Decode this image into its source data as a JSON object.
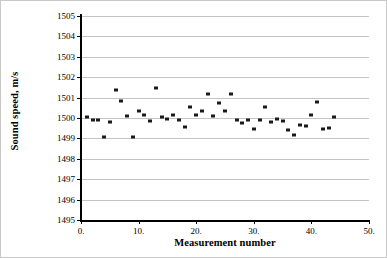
{
  "chart_data": {
    "type": "scatter",
    "title": "",
    "xlabel": "Measurement number",
    "ylabel": "Sound speed, m/s",
    "xlim": [
      0,
      50
    ],
    "ylim": [
      1495,
      1505
    ],
    "grid": true,
    "legend": false,
    "x_tick_labels": [
      "0.",
      "10.",
      "20.",
      "30.",
      "40.",
      "50."
    ],
    "x_tick_values": [
      0,
      10,
      20,
      30,
      40,
      50
    ],
    "x_minor_step": 2,
    "y_tick_labels": [
      "1495",
      "1496",
      "1497",
      "1498",
      "1499",
      "1500",
      "1501",
      "1502",
      "1503",
      "1504",
      "1505"
    ],
    "y_tick_values": [
      1495,
      1496,
      1497,
      1498,
      1499,
      1500,
      1501,
      1502,
      1503,
      1504,
      1505
    ],
    "marker": "square",
    "marker_color": "#1a1a1a",
    "gridline_color": "#c4c4c4",
    "axis_color": "#000000",
    "background_color": "#ffffff",
    "x": [
      1,
      2,
      3,
      4,
      5,
      6,
      7,
      8,
      9,
      10,
      11,
      12,
      13,
      14,
      15,
      16,
      17,
      18,
      19,
      20,
      21,
      22,
      23,
      24,
      25,
      26,
      27,
      28,
      29,
      30,
      31,
      32,
      33,
      34,
      35,
      36,
      37,
      38,
      39,
      40,
      41,
      42,
      43
    ],
    "y": [
      1500.05,
      1499.9,
      1499.9,
      1499.05,
      1499.8,
      1501.35,
      1500.85,
      1500.1,
      1499.05,
      1500.35,
      1500.15,
      1499.85,
      1501.45,
      1500.05,
      1499.95,
      1500.15,
      1499.9,
      1499.55,
      1500.55,
      1500.15,
      1500.35,
      1501.2,
      1500.1,
      1500.75,
      1500.35,
      1501.2,
      1499.9,
      1499.75,
      1499.9,
      1499.45,
      1499.9,
      1500.55,
      1499.8,
      1499.95,
      1499.85,
      1499.4,
      1499.15,
      1499.65,
      1499.6,
      1500.15,
      1500.8,
      1499.45,
      1499.5,
      1500.05
    ],
    "series": [
      {
        "name": "Sound speed measurements",
        "points": [
          {
            "x": 1,
            "y": 1500.05
          },
          {
            "x": 2,
            "y": 1499.9
          },
          {
            "x": 3,
            "y": 1499.9
          },
          {
            "x": 4,
            "y": 1499.05
          },
          {
            "x": 5,
            "y": 1499.8
          },
          {
            "x": 6,
            "y": 1501.35
          },
          {
            "x": 7,
            "y": 1500.85
          },
          {
            "x": 8,
            "y": 1500.1
          },
          {
            "x": 9,
            "y": 1499.05
          },
          {
            "x": 10,
            "y": 1500.35
          },
          {
            "x": 11,
            "y": 1500.15
          },
          {
            "x": 12,
            "y": 1499.85
          },
          {
            "x": 13,
            "y": 1501.45
          },
          {
            "x": 14,
            "y": 1500.05
          },
          {
            "x": 15,
            "y": 1499.95
          },
          {
            "x": 16,
            "y": 1500.15
          },
          {
            "x": 17,
            "y": 1499.9
          },
          {
            "x": 18,
            "y": 1499.55
          },
          {
            "x": 19,
            "y": 1500.55
          },
          {
            "x": 20,
            "y": 1500.15
          },
          {
            "x": 21,
            "y": 1500.35
          },
          {
            "x": 22,
            "y": 1501.2
          },
          {
            "x": 23,
            "y": 1500.1
          },
          {
            "x": 24,
            "y": 1500.75
          },
          {
            "x": 25,
            "y": 1500.35
          },
          {
            "x": 26,
            "y": 1501.2
          },
          {
            "x": 27,
            "y": 1499.9
          },
          {
            "x": 28,
            "y": 1499.75
          },
          {
            "x": 29,
            "y": 1499.9
          },
          {
            "x": 30,
            "y": 1499.45
          },
          {
            "x": 31,
            "y": 1499.9
          },
          {
            "x": 32,
            "y": 1500.55
          },
          {
            "x": 33,
            "y": 1499.8
          },
          {
            "x": 34,
            "y": 1499.95
          },
          {
            "x": 35,
            "y": 1499.85
          },
          {
            "x": 36,
            "y": 1499.4
          },
          {
            "x": 37,
            "y": 1499.15
          },
          {
            "x": 38,
            "y": 1499.65
          },
          {
            "x": 39,
            "y": 1499.6
          },
          {
            "x": 40,
            "y": 1500.15
          },
          {
            "x": 41,
            "y": 1500.8
          },
          {
            "x": 42,
            "y": 1499.45
          },
          {
            "x": 43,
            "y": 1499.5
          },
          {
            "x": 44,
            "y": 1500.05
          }
        ]
      }
    ]
  }
}
